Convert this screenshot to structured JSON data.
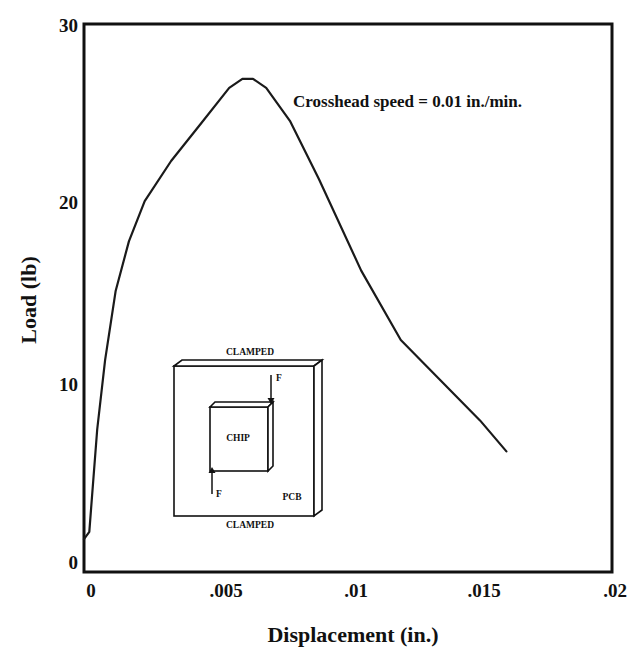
{
  "chart_data": {
    "type": "line",
    "title": "",
    "xlabel": "Displacement (in.)",
    "ylabel": "Load (lb)",
    "xlim": [
      0,
      0.02
    ],
    "ylim": [
      0,
      30
    ],
    "grid": false,
    "legend": null,
    "x_ticks": [
      0,
      0.005,
      0.01,
      0.015,
      0.02
    ],
    "x_tick_labels": [
      "0",
      ".005",
      ".01",
      ".015",
      ".02"
    ],
    "y_ticks": [
      0,
      10,
      20,
      30
    ],
    "y_tick_labels": [
      "0",
      "10",
      "20",
      "30"
    ],
    "annotations": [
      "Crosshead speed = 0.01 in./min."
    ],
    "series": [
      {
        "name": "Load-displacement",
        "color": "#1a1a1a",
        "x": [
          0,
          0.0002,
          0.0005,
          0.0008,
          0.0012,
          0.0017,
          0.0023,
          0.0033,
          0.0044,
          0.0055,
          0.006,
          0.0064,
          0.0069,
          0.0078,
          0.0089,
          0.0105,
          0.012,
          0.0135,
          0.015,
          0.016
        ],
        "y": [
          1.8,
          2.2,
          7.8,
          11.6,
          15.4,
          18.1,
          20.3,
          22.5,
          24.5,
          26.5,
          27.0,
          27.0,
          26.5,
          24.7,
          21.5,
          16.5,
          12.7,
          10.5,
          8.3,
          6.6
        ]
      }
    ],
    "inset": {
      "description": "Schematic of PCB clamped top and bottom with chip loaded by opposing forces F",
      "labels": {
        "top": "CLAMPED",
        "bottom": "CLAMPED",
        "chip": "CHIP",
        "board": "PCB",
        "force_top": "F",
        "force_bottom": "F"
      }
    }
  },
  "colors": {
    "ink": "#111111",
    "background": "#ffffff"
  }
}
